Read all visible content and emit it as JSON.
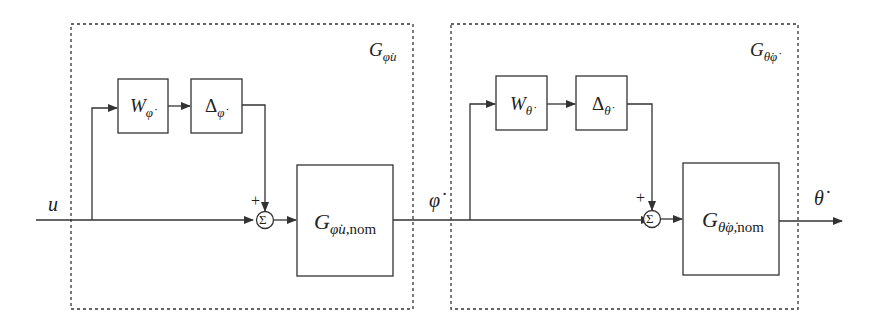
{
  "diagram": {
    "type": "block-diagram",
    "colors": {
      "line": "#333333",
      "background": "#ffffff"
    },
    "signals": {
      "input": "u",
      "intermediate": "φ̇",
      "output": "θ̇"
    },
    "groups": [
      {
        "id": "left",
        "label_main": "G",
        "label_sub": "φ̇u",
        "blocks": {
          "weight": {
            "main": "W",
            "sub": "φ̇"
          },
          "delta": {
            "main": "Δ",
            "sub": "φ̇"
          },
          "nominal": {
            "main": "G",
            "sub": "φ̇u,",
            "sub2": "nom"
          }
        },
        "sum": {
          "symbol": "Σ",
          "sign": "+"
        }
      },
      {
        "id": "right",
        "label_main": "G",
        "label_sub": "θ̇φ̇",
        "blocks": {
          "weight": {
            "main": "W",
            "sub": "θ̇"
          },
          "delta": {
            "main": "Δ",
            "sub": "θ̇"
          },
          "nominal": {
            "main": "G",
            "sub": "θ̇φ̇,",
            "sub2": "nom"
          }
        },
        "sum": {
          "symbol": "Σ",
          "sign": "+"
        }
      }
    ]
  }
}
